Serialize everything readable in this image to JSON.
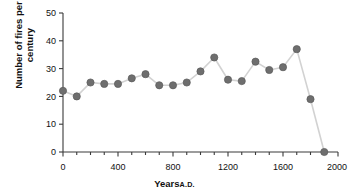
{
  "figure": {
    "top_fragment": "",
    "axes": {
      "y_axis_label": "Number of fires per century",
      "x_axis_label_main": "Years",
      "x_axis_label_small": "A.D.",
      "y_ticks": [
        "0",
        "10",
        "20",
        "30",
        "40",
        "50"
      ],
      "x_ticks": [
        "0",
        "400",
        "800",
        "1200",
        "1600",
        "2000"
      ]
    },
    "colors": {
      "marker": "#6e6e6e",
      "marker_edge": "#5a5a5a",
      "line": "#d2d2d2",
      "axis": "#3a3a3a",
      "text": "#111111",
      "background": "#ffffff"
    }
  },
  "chart_data": {
    "type": "line",
    "title": "",
    "subtitle": "",
    "xlabel": "Years A.D.",
    "ylabel": "Number of fires per century",
    "xlim": [
      0,
      2000
    ],
    "ylim": [
      0,
      50
    ],
    "x_major_tick_step": 400,
    "x_minor_tick_step": 100,
    "y_major_tick_step": 10,
    "grid": false,
    "legend": null,
    "legend_position": "none",
    "marker": "circle",
    "x": [
      0,
      100,
      200,
      300,
      400,
      500,
      600,
      700,
      800,
      900,
      1000,
      1100,
      1200,
      1300,
      1400,
      1500,
      1600,
      1700,
      1800,
      1900
    ],
    "values": [
      22,
      20,
      25,
      24.5,
      24.5,
      26.5,
      28,
      24,
      24,
      25,
      29,
      34,
      26,
      25.5,
      32.5,
      29.5,
      30.5,
      37,
      19,
      0
    ],
    "series": [
      {
        "name": "Number of fires per century",
        "x": [
          0,
          100,
          200,
          300,
          400,
          500,
          600,
          700,
          800,
          900,
          1000,
          1100,
          1200,
          1300,
          1400,
          1500,
          1600,
          1700,
          1800,
          1900
        ],
        "values": [
          22,
          20,
          25,
          24.5,
          24.5,
          26.5,
          28,
          24,
          24,
          25,
          29,
          34,
          26,
          25.5,
          32.5,
          29.5,
          30.5,
          37,
          19,
          0
        ]
      }
    ],
    "annotations": []
  }
}
